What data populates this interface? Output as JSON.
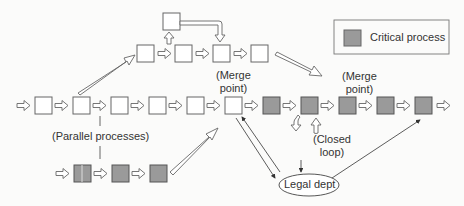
{
  "legend": {
    "label": "Critical process",
    "swatch_color": "#9a9a9a"
  },
  "labels": {
    "merge_point_1": "(Merge\npoint)",
    "merge_point_1_line1": "(Merge",
    "merge_point_1_line2": "point)",
    "merge_point_2_line1": "(Merge",
    "merge_point_2_line2": "point)",
    "parallel": "(Parallel processes)",
    "closed_loop_line1": "(Closed",
    "closed_loop_line2": "loop)",
    "legal": "Legal dept"
  },
  "colors": {
    "critical": "#9a9a9a",
    "normal": "#ffffff",
    "stroke": "#555555"
  },
  "main_row": {
    "boxes": [
      "normal",
      "normal",
      "normal",
      "normal",
      "normal",
      "critical",
      "critical",
      "critical",
      "critical",
      "critical",
      "critical"
    ]
  },
  "upper_row": {
    "boxes": [
      "normal",
      "normal",
      "normal",
      "normal"
    ],
    "top_box": "normal"
  },
  "lower_row": {
    "boxes": [
      "critical",
      "critical",
      "critical"
    ]
  }
}
